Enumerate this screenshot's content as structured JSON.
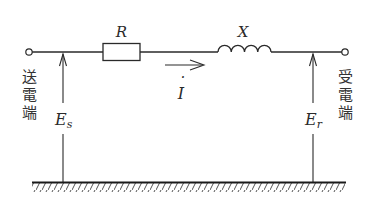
{
  "diagram": {
    "type": "single-phase transmission line equivalent circuit",
    "components": {
      "resistor": {
        "label": "R"
      },
      "inductor": {
        "label": "X"
      },
      "current": {
        "label": "I",
        "dot": "·"
      }
    },
    "terminals": {
      "sending": {
        "label_chars": [
          "送",
          "電",
          "端"
        ],
        "label": "送電端",
        "voltage_main": "E",
        "voltage_sub": "s"
      },
      "receiving": {
        "label_chars": [
          "受",
          "電",
          "端"
        ],
        "label": "受電端",
        "voltage_main": "E",
        "voltage_sub": "r"
      }
    },
    "ground": {
      "label": ""
    },
    "colors": {
      "line": "#2a2a2a",
      "background": "#ffffff"
    }
  }
}
